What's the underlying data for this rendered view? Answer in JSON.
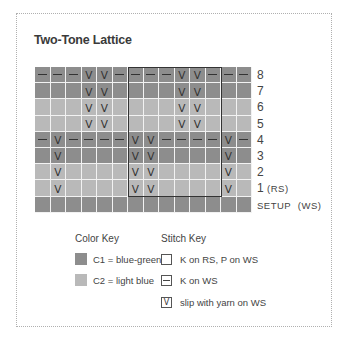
{
  "title": "Two-Tone Lattice",
  "colors": {
    "C1": "#8d8d8d",
    "C2": "#b9b9b9",
    "grid_line": "#f2f2f2",
    "repeat_box": "#333333"
  },
  "chart": {
    "columns": 14,
    "repeat_box": {
      "start_col": 6,
      "end_col": 11,
      "top_row": "8",
      "bottom_row": "1"
    },
    "rows": [
      {
        "label": "8",
        "label_suffix": "",
        "color": "dark",
        "cells": [
          "-",
          "-",
          "-",
          "V",
          "V",
          "-",
          "-",
          "-",
          "-",
          "V",
          "V",
          "-",
          "-",
          "-"
        ]
      },
      {
        "label": "7",
        "label_suffix": "",
        "color": "dark",
        "cells": [
          "",
          "",
          "",
          "V",
          "V",
          "",
          "",
          "",
          "",
          "V",
          "V",
          "",
          "",
          ""
        ]
      },
      {
        "label": "6",
        "label_suffix": "",
        "color": "light",
        "cells": [
          "",
          "",
          "",
          "V",
          "V",
          "",
          "",
          "",
          "",
          "V",
          "V",
          "",
          "",
          ""
        ]
      },
      {
        "label": "5",
        "label_suffix": "",
        "color": "light",
        "cells": [
          "",
          "",
          "",
          "V",
          "V",
          "",
          "",
          "",
          "",
          "V",
          "V",
          "",
          "",
          ""
        ]
      },
      {
        "label": "4",
        "label_suffix": "",
        "color": "dark",
        "cells": [
          "-",
          "V",
          "-",
          "-",
          "-",
          "-",
          "V",
          "V",
          "-",
          "-",
          "-",
          "-",
          "V",
          "-"
        ]
      },
      {
        "label": "3",
        "label_suffix": "",
        "color": "dark",
        "cells": [
          "",
          "V",
          "",
          "",
          "",
          "",
          "V",
          "V",
          "",
          "",
          "",
          "",
          "V",
          ""
        ]
      },
      {
        "label": "2",
        "label_suffix": "",
        "color": "light",
        "cells": [
          "",
          "V",
          "",
          "",
          "",
          "",
          "V",
          "V",
          "",
          "",
          "",
          "",
          "V",
          ""
        ]
      },
      {
        "label": "1",
        "label_suffix": "(RS)",
        "color": "light",
        "cells": [
          "",
          "V",
          "",
          "",
          "",
          "",
          "V",
          "V",
          "",
          "",
          "",
          "",
          "V",
          ""
        ]
      },
      {
        "label": "SETUP",
        "label_suffix": "(WS)",
        "color": "dark",
        "cells": [
          "",
          "",
          "",
          "",
          "",
          "",
          "",
          "",
          "",
          "",
          "",
          "",
          "",
          ""
        ]
      }
    ]
  },
  "color_key": {
    "title": "Color Key",
    "items": [
      {
        "swatch": "dark",
        "label": "C1 = blue-green"
      },
      {
        "swatch": "light",
        "label": "C2 = light blue"
      }
    ]
  },
  "stitch_key": {
    "title": "Stitch Key",
    "items": [
      {
        "symbol": "",
        "label": "K on RS, P on WS"
      },
      {
        "symbol": "-",
        "label": "K on WS"
      },
      {
        "symbol": "V",
        "label": "slip with yarn on WS"
      }
    ]
  }
}
